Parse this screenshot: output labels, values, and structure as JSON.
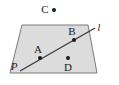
{
  "figure": {
    "type": "geometry-diagram",
    "background_color": "#ffffff",
    "plane": {
      "label": "P",
      "label_style": "italic",
      "fill_color": "#dcdcdc",
      "stroke_color": "#7a7a7a",
      "shape": "parallelogram",
      "vertices": [
        {
          "x": 22,
          "y": 25
        },
        {
          "x": 88,
          "y": 25
        },
        {
          "x": 97,
          "y": 73
        },
        {
          "x": 10,
          "y": 73
        }
      ],
      "label_position": {
        "x": 14,
        "y": 70
      }
    },
    "line": {
      "label": "l",
      "label_style": "italic",
      "stroke_color": "#3a3a3a",
      "start": {
        "x": 20,
        "y": 71
      },
      "end": {
        "x": 95,
        "y": 28
      },
      "label_position": {
        "x": 96,
        "y": 31
      }
    },
    "points": [
      {
        "label": "C",
        "x": 54,
        "y": 10,
        "label_x": 44,
        "label_y": 13,
        "location": "outside-plane",
        "on_line": false,
        "marker_color": "#1a1a1a"
      },
      {
        "label": "A",
        "x": 40,
        "y": 58,
        "label_x": 35,
        "label_y": 53,
        "location": "in-plane",
        "on_line": true,
        "marker_color": "#1a1a1a"
      },
      {
        "label": "B",
        "x": 74,
        "y": 40,
        "label_x": 69,
        "label_y": 35,
        "location": "in-plane",
        "on_line": true,
        "marker_color": "#1a1a1a"
      },
      {
        "label": "D",
        "x": 68,
        "y": 58,
        "label_x": 64,
        "label_y": 71,
        "location": "in-plane",
        "on_line": false,
        "marker_color": "#1a1a1a"
      }
    ]
  }
}
